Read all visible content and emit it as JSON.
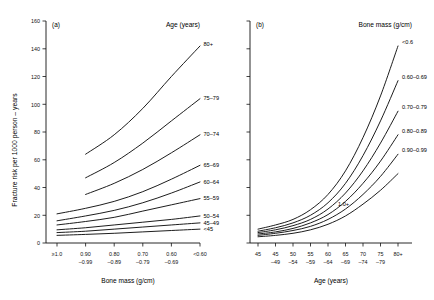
{
  "figure": {
    "panel_a_tag": "(a)",
    "panel_b_tag": "(b)"
  },
  "chart_data": [
    {
      "type": "line",
      "panel": "(a)",
      "title": "",
      "xlabel": "Bone mass (g/cm)",
      "ylabel": "Fracture risk per 1000 person – years",
      "legend_title": "Age (years)",
      "legend_position": "inline-right-of-curve-ends",
      "grid": false,
      "ylim": [
        0,
        160
      ],
      "yticks": [
        0,
        20,
        40,
        60,
        80,
        100,
        120,
        140,
        160
      ],
      "categories": [
        "≥1.0",
        "0.90\n–0.99",
        "0.80\n–0.89",
        "0.70\n–0.79",
        "0.60\n–0.69",
        "<0.60"
      ],
      "xtick_top": [
        "≥1.0",
        "0.90",
        "0.80",
        "0.70",
        "0.60",
        "<0.60"
      ],
      "xtick_bottom": [
        "",
        "–0.99",
        "–0.89",
        "–0.79",
        "–0.69",
        ""
      ],
      "series": [
        {
          "name": "80+",
          "values": [
            null,
            64,
            78,
            97,
            120,
            142
          ]
        },
        {
          "name": "75–79",
          "values": [
            null,
            47,
            58,
            72,
            88,
            104
          ]
        },
        {
          "name": "70–74",
          "values": [
            null,
            35,
            43,
            53,
            65,
            78
          ]
        },
        {
          "name": "65–69",
          "values": [
            21,
            25,
            30,
            37,
            46,
            56
          ]
        },
        {
          "name": "60–64",
          "values": [
            16,
            19.5,
            23.5,
            29,
            36,
            44
          ]
        },
        {
          "name": "55–59",
          "values": [
            13,
            15.5,
            18.5,
            23,
            27.5,
            32
          ]
        },
        {
          "name": "50–54",
          "values": [
            9.5,
            11,
            13,
            15,
            17,
            19.5
          ]
        },
        {
          "name": "45–49",
          "values": [
            7.5,
            8.5,
            10,
            11.5,
            13,
            14.5
          ]
        },
        {
          "name": "<45",
          "values": [
            5.5,
            6.2,
            7,
            8,
            9,
            10
          ]
        }
      ]
    },
    {
      "type": "line",
      "panel": "(b)",
      "title": "",
      "xlabel": "Age (years)",
      "ylabel": "",
      "legend_title": "Bone mass (g/cm)",
      "legend_position": "inline-right-of-curve-ends",
      "grid": false,
      "ylim": [
        0,
        160
      ],
      "yticks": [
        0,
        20,
        40,
        60,
        80,
        100,
        120,
        140,
        160
      ],
      "ytick_labels_shown": false,
      "categories": [
        "<45",
        "45–49",
        "50–54",
        "55–59",
        "60–64",
        "65–69",
        "70–74",
        "75–79",
        "80+"
      ],
      "xtick_top": [
        "45",
        "45",
        "50",
        "55",
        "60",
        "65",
        "70",
        "75",
        "80+"
      ],
      "xtick_bottom": [
        "",
        "–49",
        "–54",
        "–59",
        "–64",
        "–69",
        "–74",
        "–79",
        ""
      ],
      "series": [
        {
          "name": "<0.6",
          "values": [
            10,
            13,
            17,
            24,
            35,
            52,
            76,
            106,
            142
          ]
        },
        {
          "name": "0.60–0.69",
          "values": [
            8.5,
            11,
            14.5,
            20,
            29,
            43,
            63,
            88,
            117
          ]
        },
        {
          "name": "0.70–0.79",
          "values": [
            7.5,
            9.5,
            12.5,
            17,
            24.5,
            36,
            52,
            72,
            95
          ]
        },
        {
          "name": "0.80–0.89",
          "values": [
            6.5,
            8,
            10.5,
            14.5,
            20.5,
            30,
            43,
            59,
            78
          ]
        },
        {
          "name": "0.90–0.99",
          "values": [
            5.5,
            7,
            9,
            12,
            17,
            24.5,
            35,
            48,
            64
          ]
        },
        {
          "name": "1.0+",
          "values": [
            4.5,
            5.5,
            7,
            9.5,
            13.5,
            19.5,
            28,
            38,
            50
          ]
        }
      ]
    }
  ]
}
